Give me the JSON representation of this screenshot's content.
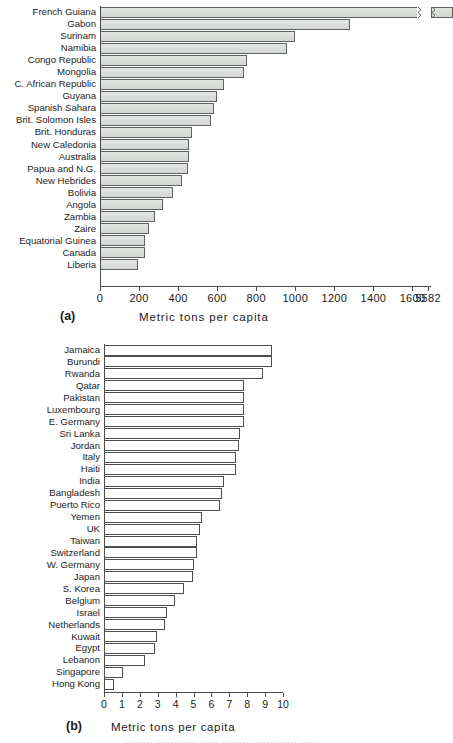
{
  "chart_data": [
    {
      "id": "a",
      "type": "bar",
      "orientation": "horizontal",
      "panel_tag": "(a)",
      "title": "",
      "xlabel": "Metric tons per capita",
      "ylabel": "",
      "xlim": [
        0,
        1700
      ],
      "grid": false,
      "legend": null,
      "axis_break": true,
      "axis_break_note": "Axis is broken after 1600; final tick label reads 5582 (French Guiana value).",
      "tick_labels": [
        "0",
        "200",
        "400",
        "600",
        "800",
        "1000",
        "1200",
        "1400",
        "1600",
        "5582"
      ],
      "tick_values": [
        0,
        200,
        400,
        600,
        800,
        1000,
        1200,
        1400,
        1600,
        5582
      ],
      "categories": [
        "French Guiana",
        "Gabon",
        "Surinam",
        "Namibia",
        "Congo Republic",
        "Mongolia",
        "C. African Republic",
        "Guyana",
        "Spanish Sahara",
        "Brit. Solomon Isles",
        "Brit. Honduras",
        "New Caledonia",
        "Australia",
        "Papua and N.G.",
        "New Hebrides",
        "Bolivia",
        "Angola",
        "Zambia",
        "Zaire",
        "Equatorial Guinea",
        "Canada",
        "Liberia"
      ],
      "values": [
        5582,
        1280,
        1000,
        955,
        755,
        735,
        635,
        600,
        585,
        570,
        470,
        455,
        455,
        450,
        420,
        375,
        325,
        280,
        250,
        230,
        230,
        195
      ],
      "bar_fill": "#dcdedc",
      "bar_edge": "#5e625e"
    },
    {
      "id": "b",
      "type": "bar",
      "orientation": "horizontal",
      "panel_tag": "(b)",
      "title": "",
      "xlabel": "Metric tons per capita",
      "ylabel": "",
      "xlim": [
        0,
        10
      ],
      "grid": false,
      "legend": null,
      "axis_break": false,
      "tick_labels": [
        "0",
        "1",
        "2",
        "3",
        "4",
        "5",
        "6",
        "7",
        "8",
        "9",
        "10"
      ],
      "tick_values": [
        0,
        1,
        2,
        3,
        4,
        5,
        6,
        7,
        8,
        9,
        10
      ],
      "categories": [
        "Jamaica",
        "Burundi",
        "Rwanda",
        "Qatar",
        "Pakistan",
        "Luxembourg",
        "E. Germany",
        "Sri Lanka",
        "Jordan",
        "Italy",
        "Haiti",
        "India",
        "Bangladesh",
        "Puerto Rico",
        "Yemen",
        "UK",
        "Taiwan",
        "Switzerland",
        "W. Germany",
        "Japan",
        "S. Korea",
        "Belgium",
        "Israel",
        "Netherlands",
        "Kuwait",
        "Egypt",
        "Lebanon",
        "Singapore",
        "Hong Kong"
      ],
      "values": [
        9.4,
        9.4,
        8.9,
        7.8,
        7.8,
        7.8,
        7.8,
        7.6,
        7.55,
        7.4,
        7.35,
        6.7,
        6.6,
        6.5,
        5.45,
        5.35,
        5.2,
        5.2,
        5.05,
        4.95,
        4.45,
        3.95,
        3.5,
        3.4,
        2.95,
        2.85,
        2.3,
        1.05,
        0.55
      ],
      "bar_fill": "#ffffff",
      "bar_edge": "#4c4f4c"
    }
  ],
  "colors": {
    "axis": "#4a4d4a",
    "text": "#1d1d1d",
    "bar_fill_a": "#dcdedc",
    "bar_edge_a": "#5e625e",
    "bar_fill_b": "#ffffff",
    "bar_edge_b": "#4c4f4c"
  },
  "footer_sliver": "........ ............ ..... ......... ............ ....."
}
